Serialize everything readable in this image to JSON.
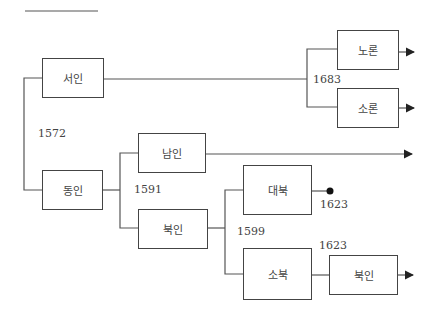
{
  "diagram": {
    "nodes": {
      "seoin": "서인",
      "dongin": "동인",
      "namin": "남인",
      "bugin": "북인",
      "daebuk": "대북",
      "sobuk": "소북",
      "bugin2": "북인",
      "noron": "노론",
      "soron": "소론"
    },
    "years": {
      "split_1572": "1572",
      "split_1591": "1591",
      "split_1599": "1599",
      "end_1623": "1623",
      "merge_1623": "1623",
      "split_1683": "1683"
    }
  }
}
